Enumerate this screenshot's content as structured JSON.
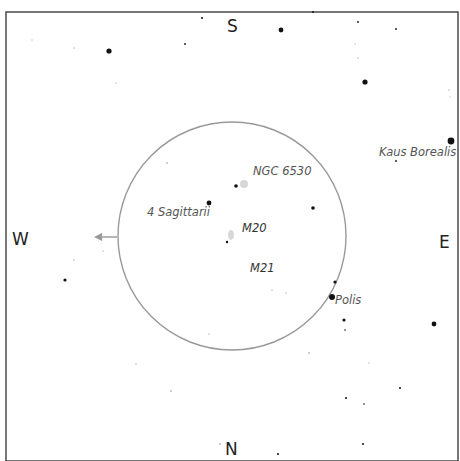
{
  "chart": {
    "type": "star-chart",
    "frame": {
      "x": 6,
      "y": 12,
      "width": 452,
      "height": 449,
      "color": "#555555"
    },
    "eyepiece_circle": {
      "cx": 232,
      "cy": 236,
      "r": 114,
      "color": "#999999"
    },
    "arrow": {
      "x1": 117,
      "y1": 237,
      "x2": 94,
      "y2": 237,
      "color": "#999999"
    },
    "cardinals": {
      "south": "S",
      "north": "N",
      "west": "W",
      "east": "E"
    },
    "labels": {
      "ngc6530": "NGC 6530",
      "four_sgr": "4 Sagittarii",
      "m20": "M20",
      "m21": "M21",
      "polis": "Polis",
      "kaus_borealis": "Kaus Borealis"
    },
    "stars": [
      [
        109,
        51,
        2.6
      ],
      [
        281,
        30,
        2.4
      ],
      [
        365,
        82,
        2.6
      ],
      [
        451,
        141,
        3.4
      ],
      [
        209,
        203,
        2.4
      ],
      [
        236,
        186,
        1.8
      ],
      [
        313,
        208,
        1.8
      ],
      [
        332,
        297,
        3.0
      ],
      [
        335,
        282,
        1.6
      ],
      [
        344,
        320,
        1.6
      ],
      [
        434,
        324,
        2.4
      ],
      [
        65,
        280,
        1.6
      ],
      [
        227,
        242,
        1.2
      ],
      [
        202,
        18,
        1.0
      ],
      [
        313,
        12,
        0.9
      ],
      [
        358,
        22,
        0.9
      ],
      [
        396,
        29,
        0.9
      ],
      [
        185,
        44,
        0.9
      ],
      [
        358,
        58,
        0.6
      ],
      [
        74,
        48,
        0.6
      ],
      [
        346,
        398,
        1.0
      ],
      [
        400,
        388,
        1.0
      ],
      [
        364,
        404,
        0.8
      ],
      [
        363,
        444,
        1.0
      ],
      [
        278,
        454,
        1.0
      ],
      [
        220,
        444,
        0.7
      ],
      [
        309,
        353,
        0.7
      ],
      [
        171,
        391,
        0.7
      ],
      [
        136,
        364,
        0.6
      ],
      [
        74,
        260,
        0.6
      ],
      [
        103,
        251,
        0.6
      ],
      [
        167,
        163,
        0.7
      ],
      [
        345,
        330,
        0.8
      ],
      [
        272,
        290,
        0.6
      ],
      [
        286,
        293,
        0.6
      ],
      [
        396,
        161,
        0.9
      ],
      [
        209,
        334,
        0.6
      ],
      [
        449,
        90,
        0.6
      ],
      [
        116,
        83,
        0.5
      ],
      [
        32,
        40,
        0.5
      ],
      [
        369,
        363,
        0.5
      ],
      [
        355,
        44,
        0.5
      ],
      [
        450,
        97,
        0.5
      ]
    ],
    "nebulae": [
      {
        "name": "NGC 6530",
        "cx": 244,
        "cy": 184,
        "rx": 4,
        "ry": 4
      },
      {
        "name": "M20",
        "cx": 231,
        "cy": 235,
        "rx": 3,
        "ry": 5
      }
    ]
  }
}
